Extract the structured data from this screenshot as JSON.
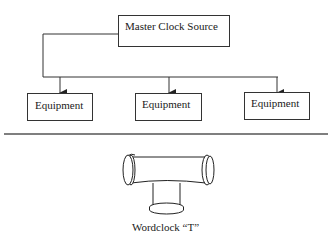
{
  "diagram": {
    "source": {
      "label": "Master Clock Source"
    },
    "targets": [
      {
        "label": "Equipment"
      },
      {
        "label": "Equipment"
      },
      {
        "label": "Equipment"
      }
    ],
    "connector_icon": "wordclock-t-connector-icon",
    "caption": "Wordclock “T”"
  }
}
